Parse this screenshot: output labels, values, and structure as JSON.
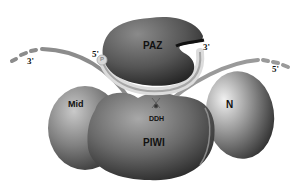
{
  "diagram": {
    "domains": {
      "paz": "PAZ",
      "mid": "Mid",
      "piwi": "PIWI",
      "n": "N",
      "ddh": "DDH"
    },
    "strand_labels": {
      "guide_5prime": "5'",
      "guide_phosphate": "P",
      "guide_3prime": "3'",
      "target_left_3prime": "3'",
      "target_right_5prime": "5'"
    },
    "colors": {
      "background": "#ffffff",
      "domain_dark": "#4a4a4a",
      "domain_mid": "#7a7a7a",
      "domain_light": "#c8c8c8",
      "rna_strand": "#9a9a9a",
      "rna_light": "#e0e0e0",
      "label": "#111111"
    }
  }
}
